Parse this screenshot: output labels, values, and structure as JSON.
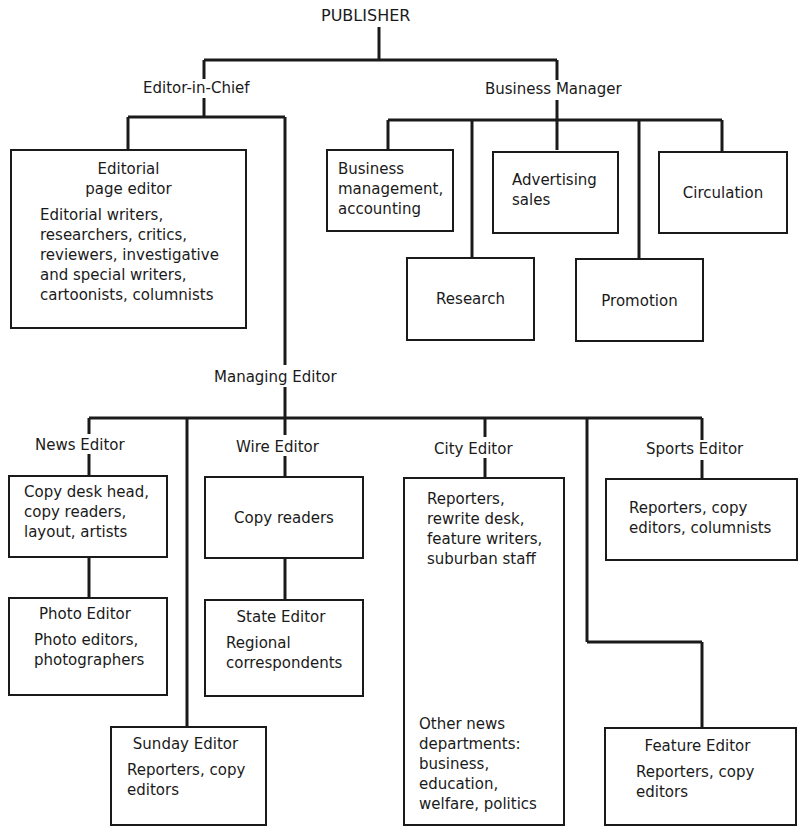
{
  "chart": {
    "title": "PUBLISHER",
    "editor_in_chief": "Editor-in-Chief",
    "business_manager": "Business Manager",
    "managing_editor": "Managing Editor",
    "editorial_page": {
      "head": "Editorial\npage editor",
      "body": "Editorial writers,\nresearchers, critics,\nreviewers, investigative\nand special writers,\ncartoonists, columnists"
    },
    "business": {
      "accounting": "Business\nmanagement,\naccounting",
      "advertising": "Advertising\nsales",
      "circulation": "Circulation",
      "research": "Research",
      "promotion": "Promotion"
    },
    "news_editor": {
      "label": "News Editor",
      "body": "Copy desk head,\ncopy readers,\nlayout, artists"
    },
    "photo_editor": {
      "head": "Photo Editor",
      "body": "Photo editors,\nphotographers"
    },
    "wire_editor": {
      "label": "Wire Editor",
      "body": "Copy readers"
    },
    "state_editor": {
      "head": "State Editor",
      "body": "Regional\ncorrespondents"
    },
    "sunday_editor": {
      "head": "Sunday Editor",
      "body": "Reporters, copy\neditors"
    },
    "city_editor": {
      "label": "City Editor",
      "body": "Reporters,\nrewrite desk,\nfeature writers,\nsuburban staff",
      "other": "Other news\ndepartments:\nbusiness,\neducation,\nwelfare, politics"
    },
    "sports_editor": {
      "label": "Sports Editor",
      "body": "Reporters, copy\neditors, columnists"
    },
    "feature_editor": {
      "head": "Feature Editor",
      "body": "Reporters, copy\neditors"
    }
  }
}
